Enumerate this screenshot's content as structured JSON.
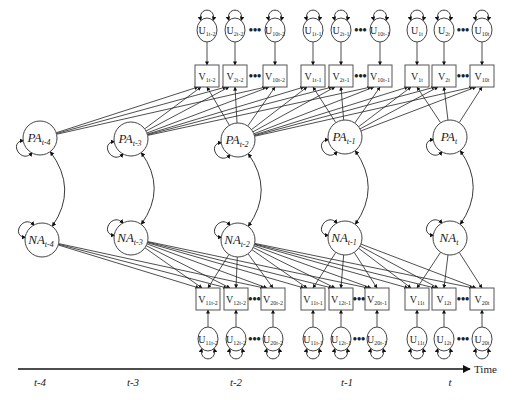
{
  "diagram": {
    "type": "structural equation model path diagram",
    "axis": {
      "title": "Time",
      "ticks": [
        "t-4",
        "t-3",
        "t-2",
        "t-1",
        "t"
      ]
    },
    "latent_factors": {
      "positive_affect": [
        {
          "id": "PA_t-4",
          "base": "PA",
          "sub": "t-4",
          "x": 40,
          "y": 138
        },
        {
          "id": "PA_t-3",
          "base": "PA",
          "sub": "t-3",
          "x": 131,
          "y": 139
        },
        {
          "id": "PA_t-2",
          "base": "PA",
          "sub": "t-2",
          "x": 238,
          "y": 140
        },
        {
          "id": "PA_t-1",
          "base": "PA",
          "sub": "t-1",
          "x": 345,
          "y": 137
        },
        {
          "id": "PA_t",
          "base": "PA",
          "sub": "t",
          "x": 450,
          "y": 137
        }
      ],
      "negative_affect": [
        {
          "id": "NA_t-4",
          "base": "NA",
          "sub": "t-4",
          "x": 42,
          "y": 240
        },
        {
          "id": "NA_t-3",
          "base": "NA",
          "sub": "t-3",
          "x": 131,
          "y": 238
        },
        {
          "id": "NA_t-2",
          "base": "NA",
          "sub": "t-2",
          "x": 238,
          "y": 240
        },
        {
          "id": "NA_t-1",
          "base": "NA",
          "sub": "t-1",
          "x": 345,
          "y": 238
        },
        {
          "id": "NA_t",
          "base": "NA",
          "sub": "t",
          "x": 450,
          "y": 238
        }
      ]
    },
    "top_indicators": [
      {
        "period": "t-2",
        "items": [
          {
            "v": "1t-2",
            "u": "1t-2",
            "x": 207
          },
          {
            "v": "2t-2",
            "u": "2t-2",
            "x": 235
          },
          {
            "v": "10t-2",
            "u": "10t-2",
            "x": 275
          }
        ]
      },
      {
        "period": "t-1",
        "items": [
          {
            "v": "1t-1",
            "u": "1t-1",
            "x": 313
          },
          {
            "v": "2t-1",
            "u": "2t-1",
            "x": 341
          },
          {
            "v": "10t-1",
            "u": "10t-1",
            "x": 380
          }
        ]
      },
      {
        "period": "t",
        "items": [
          {
            "v": "1t",
            "u": "1t",
            "x": 417
          },
          {
            "v": "2t",
            "u": "2t",
            "x": 444
          },
          {
            "v": "10t",
            "u": "10t",
            "x": 482
          }
        ]
      }
    ],
    "bottom_indicators": [
      {
        "period": "t-2",
        "items": [
          {
            "v": "11t-2",
            "u": "11t-2",
            "x": 208
          },
          {
            "v": "12t-2",
            "u": "12t-2",
            "x": 236
          },
          {
            "v": "20t-2",
            "u": "20t-2",
            "x": 273
          }
        ]
      },
      {
        "period": "t-1",
        "items": [
          {
            "v": "11t-1",
            "u": "11t-1",
            "x": 313
          },
          {
            "v": "12t-1",
            "u": "12t-1",
            "x": 341
          },
          {
            "v": "20t-1",
            "u": "20t-1",
            "x": 377
          }
        ]
      },
      {
        "period": "t",
        "items": [
          {
            "v": "11t",
            "u": "11t",
            "x": 417
          },
          {
            "v": "12t",
            "u": "12t",
            "x": 444
          },
          {
            "v": "20t",
            "u": "20t",
            "x": 482
          }
        ]
      }
    ],
    "ellipsis": "•••",
    "letters": {
      "observed": "V",
      "unique": "U"
    }
  }
}
